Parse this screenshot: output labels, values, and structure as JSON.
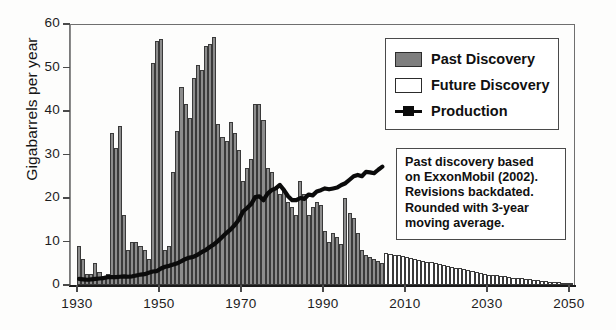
{
  "chart_data": {
    "type": "bar",
    "title": "",
    "xlabel": "",
    "ylabel": "Gigabarrels per year",
    "xlim": [
      1928,
      2052
    ],
    "ylim": [
      0,
      60
    ],
    "grid": false,
    "legend_position": "top-right",
    "y_ticks": [
      0,
      10,
      20,
      30,
      40,
      50,
      60
    ],
    "x_ticks": [
      1930,
      1950,
      1970,
      1990,
      2010,
      2030,
      2050
    ],
    "legend": [
      "Past Discovery",
      "Future Discovery",
      "Production"
    ],
    "annotation": "Past discovery based on ExxonMobil (2002). Revisions backdated. Rounded with 3-year moving average.",
    "credit": "Credit: the Association for the Study of Peak Oil",
    "colors": {
      "past_discovery_fill": "#8d8d8d",
      "past_discovery_edge": "#3a3a3a",
      "future_discovery_fill": "#ffffff",
      "future_discovery_edge": "#3a3a3a",
      "production_line": "#0b0b0b",
      "axis": "#4a4a4a",
      "background": "#fdfdfc"
    },
    "series": [
      {
        "name": "Past Discovery",
        "x": [
          1930,
          1931,
          1932,
          1933,
          1934,
          1935,
          1936,
          1937,
          1938,
          1939,
          1940,
          1941,
          1942,
          1943,
          1944,
          1945,
          1946,
          1947,
          1948,
          1949,
          1950,
          1951,
          1952,
          1953,
          1954,
          1955,
          1956,
          1957,
          1958,
          1959,
          1960,
          1961,
          1962,
          1963,
          1964,
          1965,
          1966,
          1967,
          1968,
          1969,
          1970,
          1971,
          1972,
          1973,
          1974,
          1975,
          1976,
          1977,
          1978,
          1979,
          1980,
          1981,
          1982,
          1983,
          1984,
          1985,
          1986,
          1987,
          1988,
          1989,
          1990,
          1991,
          1992,
          1993,
          1994,
          1995,
          1996,
          1997,
          1998,
          1999,
          2000,
          2001,
          2002,
          2003,
          2004
        ],
        "values": [
          9,
          6,
          2.5,
          2.5,
          5,
          3,
          2,
          2.5,
          35,
          31.5,
          36.5,
          16,
          8,
          10,
          10,
          9,
          8,
          6,
          51,
          56,
          56.5,
          8,
          9,
          26,
          35.5,
          45.5,
          41.5,
          38.5,
          47.5,
          50.5,
          49.5,
          55,
          55.5,
          57,
          37,
          34,
          33,
          37.5,
          35,
          31,
          24,
          27,
          29,
          41.5,
          41.5,
          38,
          27,
          26,
          22,
          21,
          22,
          19,
          18,
          16,
          24,
          21,
          16,
          18,
          19,
          18.5,
          12.5,
          10,
          12,
          11,
          9.5,
          20,
          16.5,
          15.5,
          12,
          8,
          7,
          6.5,
          6,
          5.5,
          5
        ]
      },
      {
        "name": "Future Discovery",
        "x": [
          2005,
          2006,
          2007,
          2008,
          2009,
          2010,
          2011,
          2012,
          2013,
          2014,
          2015,
          2016,
          2017,
          2018,
          2019,
          2020,
          2021,
          2022,
          2023,
          2024,
          2025,
          2026,
          2027,
          2028,
          2029,
          2030,
          2031,
          2032,
          2033,
          2034,
          2035,
          2036,
          2037,
          2038,
          2039,
          2040,
          2041,
          2042,
          2043,
          2044,
          2045,
          2046,
          2047,
          2048,
          2049,
          2050
        ],
        "values": [
          7.4,
          7.2,
          7.0,
          6.8,
          6.6,
          6.4,
          6.2,
          6.0,
          5.8,
          5.6,
          5.4,
          5.2,
          5.0,
          4.8,
          4.6,
          4.4,
          4.2,
          4.0,
          3.8,
          3.6,
          3.4,
          3.2,
          3.0,
          2.8,
          2.6,
          2.4,
          2.3,
          2.2,
          2.1,
          2.0,
          1.8,
          1.7,
          1.6,
          1.5,
          1.4,
          1.3,
          1.2,
          1.1,
          1.0,
          0.9,
          0.8,
          0.7,
          0.6,
          0.5,
          0.4,
          0.3
        ]
      },
      {
        "name": "Production",
        "x": [
          1930,
          1931,
          1932,
          1933,
          1934,
          1935,
          1936,
          1937,
          1938,
          1939,
          1940,
          1941,
          1942,
          1943,
          1944,
          1945,
          1946,
          1947,
          1948,
          1949,
          1950,
          1951,
          1952,
          1953,
          1954,
          1955,
          1956,
          1957,
          1958,
          1959,
          1960,
          1961,
          1962,
          1963,
          1964,
          1965,
          1966,
          1967,
          1968,
          1969,
          1970,
          1971,
          1972,
          1973,
          1974,
          1975,
          1976,
          1977,
          1978,
          1979,
          1980,
          1981,
          1982,
          1983,
          1984,
          1985,
          1986,
          1987,
          1988,
          1989,
          1990,
          1991,
          1992,
          1993,
          1994,
          1995,
          1996,
          1997,
          1998,
          1999,
          2000,
          2001,
          2002,
          2003,
          2004
        ],
        "values": [
          1.4,
          1.3,
          1.2,
          1.3,
          1.4,
          1.5,
          1.6,
          1.8,
          1.8,
          1.8,
          1.9,
          2.0,
          1.9,
          2.0,
          2.2,
          2.4,
          2.5,
          2.8,
          3.1,
          3.2,
          3.8,
          4.2,
          4.4,
          4.7,
          5.0,
          5.5,
          6.0,
          6.3,
          6.5,
          7.0,
          7.6,
          8.1,
          8.8,
          9.4,
          10.2,
          11.1,
          12.0,
          12.8,
          13.8,
          15.0,
          16.9,
          17.7,
          18.6,
          20.2,
          20.4,
          19.5,
          21.0,
          21.8,
          22.2,
          23.0,
          21.8,
          20.4,
          19.5,
          19.5,
          20.0,
          19.8,
          20.8,
          20.6,
          21.5,
          21.8,
          22.2,
          22.0,
          22.2,
          22.4,
          23.0,
          23.4,
          24.2,
          25.0,
          25.3,
          25.0,
          26.0,
          25.9,
          25.7,
          26.5,
          27.2
        ]
      }
    ]
  },
  "axis": {
    "ylabel": "Gigabarrels per year",
    "y_tick_labels": [
      "0",
      "10",
      "20",
      "30",
      "40",
      "50",
      "60"
    ],
    "x_tick_labels": [
      "1930",
      "1950",
      "1970",
      "1990",
      "2010",
      "2030",
      "2050"
    ]
  },
  "legend": {
    "items": [
      {
        "label": "Past Discovery",
        "swatch": "filled-gray-square"
      },
      {
        "label": "Future Discovery",
        "swatch": "empty-white-square"
      },
      {
        "label": "Production",
        "swatch": "black-line-marker"
      }
    ]
  },
  "note": {
    "lines": [
      "Past discovery based",
      "on ExxonMobil (2002).",
      "Revisions backdated.",
      "Rounded with 3-year",
      "moving average."
    ]
  },
  "credit": {
    "text": "Credit: the Association for the Study of Peak Oil"
  }
}
